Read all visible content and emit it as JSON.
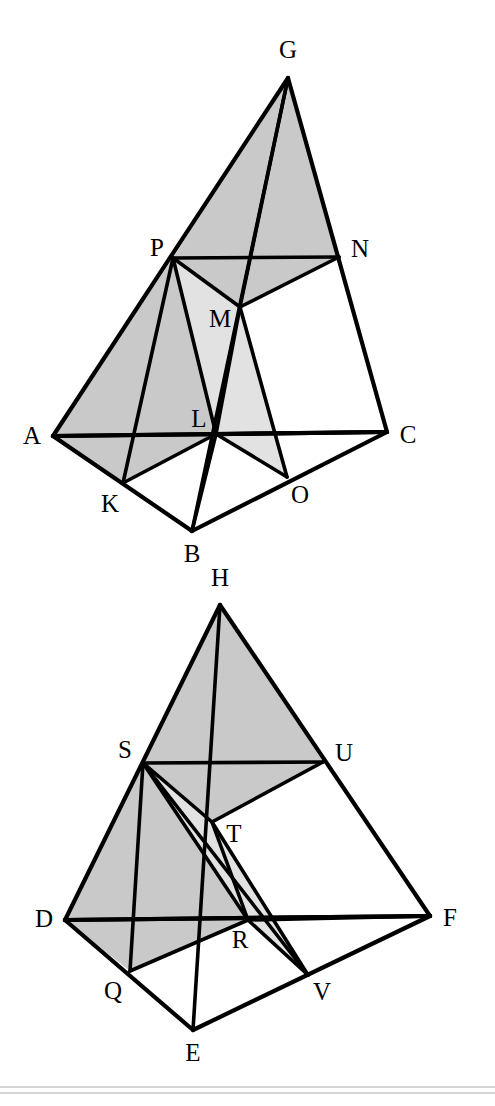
{
  "figure": {
    "canvas": {
      "width": 495,
      "height": 1106,
      "background": "#ffffff"
    },
    "colors": {
      "stroke": "#000000",
      "shade_dark": "#c9c9c9",
      "shade_light": "#e2e2e2",
      "white": "#ffffff",
      "rule": "#a8a8a8"
    },
    "stroke_widths": {
      "edge": 4.2,
      "inner": 3.6,
      "rule": 1.0
    },
    "label_font_size": 25,
    "diagrams": [
      {
        "name": "upper-tetrahedron",
        "points": {
          "G": {
            "x": 288,
            "y": 78
          },
          "A": {
            "x": 53,
            "y": 436
          },
          "B": {
            "x": 192,
            "y": 531
          },
          "C": {
            "x": 387,
            "y": 432
          },
          "P": {
            "x": 173,
            "y": 258
          },
          "N": {
            "x": 339,
            "y": 257
          },
          "M": {
            "x": 240,
            "y": 307
          },
          "L": {
            "x": 216,
            "y": 434
          },
          "K": {
            "x": 123,
            "y": 483
          },
          "O": {
            "x": 287,
            "y": 477
          }
        },
        "labels": [
          {
            "id": "G",
            "text": "G",
            "x": 288,
            "y": 52
          },
          {
            "id": "P",
            "text": "P",
            "x": 157,
            "y": 250
          },
          {
            "id": "N",
            "text": "N",
            "x": 360,
            "y": 251
          },
          {
            "id": "M",
            "text": "M",
            "x": 220,
            "y": 321
          },
          {
            "id": "A",
            "text": "A",
            "x": 32,
            "y": 438
          },
          {
            "id": "L",
            "text": "L",
            "x": 199,
            "y": 421
          },
          {
            "id": "C",
            "text": "C",
            "x": 408,
            "y": 437
          },
          {
            "id": "K",
            "text": "K",
            "x": 110,
            "y": 506
          },
          {
            "id": "O",
            "text": "O",
            "x": 300,
            "y": 497
          },
          {
            "id": "B",
            "text": "B",
            "x": 192,
            "y": 556
          }
        ],
        "shaded_dark": [
          [
            "A",
            "P",
            "L",
            "K"
          ]
        ],
        "shaded_medium": [
          [
            "P",
            "G",
            "N",
            "M"
          ]
        ],
        "shaded_light": [
          [
            "P",
            "M",
            "L"
          ],
          [
            "L",
            "M",
            "O"
          ]
        ],
        "edges": [
          [
            "A",
            "G"
          ],
          [
            "G",
            "C"
          ],
          [
            "A",
            "C"
          ],
          [
            "A",
            "B"
          ],
          [
            "B",
            "C"
          ],
          [
            "G",
            "B"
          ],
          [
            "P",
            "N"
          ],
          [
            "P",
            "M"
          ],
          [
            "M",
            "N"
          ],
          [
            "P",
            "L"
          ],
          [
            "M",
            "L"
          ],
          [
            "L",
            "O"
          ],
          [
            "M",
            "O"
          ],
          [
            "K",
            "L"
          ],
          [
            "K",
            "P"
          ],
          [
            "L",
            "B"
          ],
          [
            "L",
            "C"
          ],
          [
            "A",
            "C"
          ],
          [
            "G",
            "M"
          ]
        ]
      },
      {
        "name": "lower-tetrahedron",
        "points": {
          "H": {
            "x": 220,
            "y": 605
          },
          "D": {
            "x": 65,
            "y": 920
          },
          "E": {
            "x": 193,
            "y": 1030
          },
          "F": {
            "x": 430,
            "y": 916
          },
          "S": {
            "x": 143,
            "y": 763
          },
          "U": {
            "x": 323,
            "y": 762
          },
          "T": {
            "x": 212,
            "y": 822
          },
          "R": {
            "x": 248,
            "y": 920
          },
          "Q": {
            "x": 130,
            "y": 971
          },
          "V": {
            "x": 308,
            "y": 975
          }
        },
        "labels": [
          {
            "id": "H",
            "text": "H",
            "x": 220,
            "y": 580
          },
          {
            "id": "S",
            "text": "S",
            "x": 125,
            "y": 752
          },
          {
            "id": "U",
            "text": "U",
            "x": 344,
            "y": 755
          },
          {
            "id": "T",
            "text": "T",
            "x": 234,
            "y": 836
          },
          {
            "id": "D",
            "text": "D",
            "x": 44,
            "y": 921
          },
          {
            "id": "F",
            "text": "F",
            "x": 450,
            "y": 920
          },
          {
            "id": "R",
            "text": "R",
            "x": 240,
            "y": 942
          },
          {
            "id": "Q",
            "text": "Q",
            "x": 113,
            "y": 993
          },
          {
            "id": "V",
            "text": "V",
            "x": 322,
            "y": 994
          },
          {
            "id": "E",
            "text": "E",
            "x": 193,
            "y": 1055
          }
        ],
        "shaded_dark": [
          [
            "D",
            "S",
            "R",
            "Q"
          ]
        ],
        "shaded_medium": [
          [
            "S",
            "H",
            "U",
            "T"
          ]
        ],
        "shaded_light": [
          [
            "S",
            "T",
            "R"
          ],
          [
            "T",
            "R",
            "V"
          ]
        ],
        "edges": [
          [
            "D",
            "H"
          ],
          [
            "H",
            "F"
          ],
          [
            "D",
            "F"
          ],
          [
            "D",
            "E"
          ],
          [
            "E",
            "F"
          ],
          [
            "H",
            "E"
          ],
          [
            "S",
            "U"
          ],
          [
            "S",
            "T"
          ],
          [
            "T",
            "U"
          ],
          [
            "S",
            "R"
          ],
          [
            "T",
            "R"
          ],
          [
            "R",
            "V"
          ],
          [
            "T",
            "V"
          ],
          [
            "Q",
            "R"
          ],
          [
            "Q",
            "S"
          ],
          [
            "R",
            "F"
          ],
          [
            "S",
            "V"
          ],
          [
            "D",
            "F"
          ]
        ]
      }
    ],
    "bottom_rules": [
      {
        "name": "rule-upper",
        "y": 1087
      },
      {
        "name": "rule-lower",
        "y": 1093
      }
    ]
  }
}
